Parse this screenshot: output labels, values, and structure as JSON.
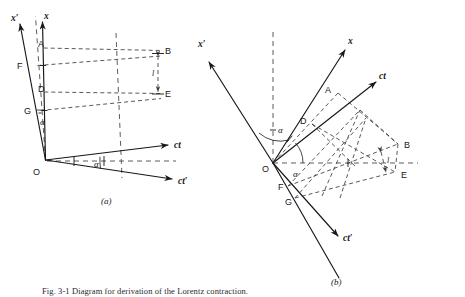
{
  "figure": {
    "caption": "Fig. 3-1  Diagram for derivation of the Lorentz contraction.",
    "panels": [
      {
        "id": "a",
        "label": "(a)"
      },
      {
        "id": "b",
        "label": "(b)"
      }
    ],
    "colors": {
      "solid_line": "#17161a",
      "dashed_line": "#3a3a40",
      "background": "#ffffff",
      "text": "#17161a"
    }
  },
  "panel_a": {
    "label": "(a)",
    "origin_label": "O",
    "axes": [
      {
        "name": "x-prime-axis",
        "label": "x′"
      },
      {
        "name": "x-axis",
        "label": "x"
      },
      {
        "name": "ct-axis",
        "label": "ct"
      },
      {
        "name": "ct-prime-axis",
        "label": "ct′"
      }
    ],
    "points": [
      {
        "name": "point-A",
        "label": "A"
      },
      {
        "name": "point-F",
        "label": "F"
      },
      {
        "name": "point-D",
        "label": "D"
      },
      {
        "name": "point-G",
        "label": "G"
      },
      {
        "name": "point-B",
        "label": "B"
      },
      {
        "name": "point-E",
        "label": "E"
      }
    ],
    "angles": [
      {
        "name": "angle-alpha-top",
        "label": "α"
      },
      {
        "name": "angle-alpha-bottom",
        "label": "α"
      }
    ],
    "measure": {
      "name": "length-l",
      "label": "l"
    }
  },
  "panel_b": {
    "label": "(b)",
    "origin_label": "O",
    "axes": [
      {
        "name": "x-prime-axis",
        "label": "x′"
      },
      {
        "name": "x-axis",
        "label": "x"
      },
      {
        "name": "ct-axis",
        "label": "ct"
      },
      {
        "name": "ct-prime-axis",
        "label": "ct′"
      }
    ],
    "points": [
      {
        "name": "point-A",
        "label": "A"
      },
      {
        "name": "point-D",
        "label": "D"
      },
      {
        "name": "point-F",
        "label": "F"
      },
      {
        "name": "point-G",
        "label": "G"
      },
      {
        "name": "point-B",
        "label": "B"
      },
      {
        "name": "point-E",
        "label": "E"
      }
    ],
    "angles": [
      {
        "name": "angle-alpha-upper",
        "label": "α"
      },
      {
        "name": "angle-alpha-lower",
        "label": "α"
      }
    ],
    "measure": {
      "name": "length-l",
      "label": "l"
    }
  }
}
